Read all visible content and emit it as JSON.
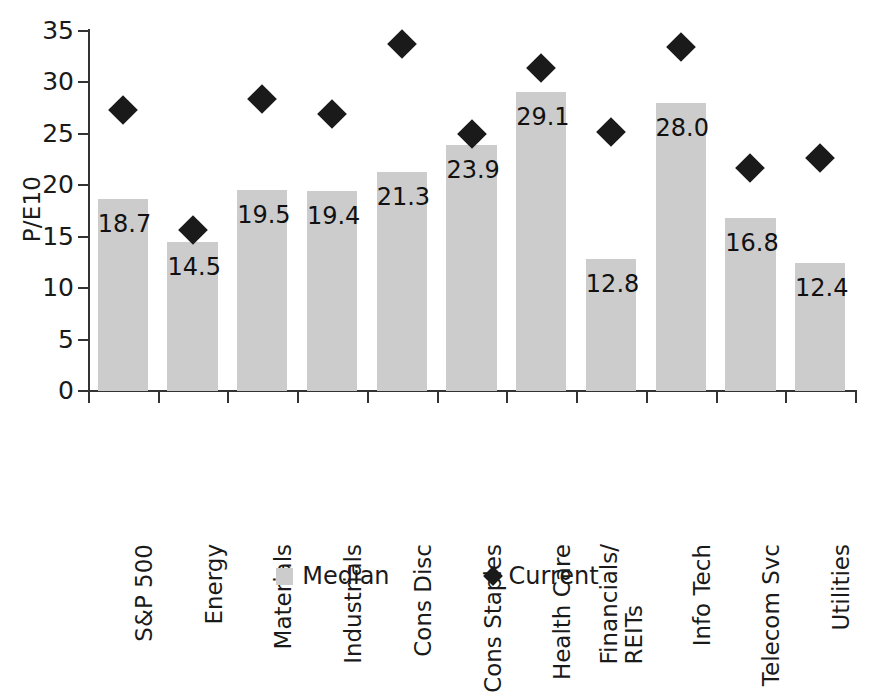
{
  "chart_data": {
    "type": "bar",
    "title": "",
    "xlabel": "",
    "ylabel": "P/E10",
    "ylim": [
      0,
      35
    ],
    "yticks": [
      0,
      5,
      10,
      15,
      20,
      25,
      30,
      35
    ],
    "grid": false,
    "legend_position": "bottom",
    "categories": [
      "S&P 500",
      "Energy",
      "Materials",
      "Industrials",
      "Cons Disc",
      "Cons Staples",
      "Health Care",
      "Financials/\nREITs",
      "Info Tech",
      "Telecom Svc",
      "Utilities"
    ],
    "series": [
      {
        "name": "Median",
        "type": "bar",
        "color": "#cccccc",
        "values": [
          18.7,
          14.5,
          19.5,
          19.4,
          21.3,
          23.9,
          29.1,
          12.8,
          28.0,
          16.8,
          12.4
        ],
        "labels": [
          "18.7",
          "14.5",
          "19.5",
          "19.4",
          "21.3",
          "23.9",
          "29.1",
          "12.8",
          "28.0",
          "16.8",
          "12.4"
        ]
      },
      {
        "name": "Current",
        "type": "scatter",
        "marker": "diamond",
        "color": "#1a1a1a",
        "values": [
          27.3,
          15.7,
          28.4,
          26.9,
          33.7,
          25.0,
          31.4,
          25.2,
          33.4,
          21.7,
          22.7
        ],
        "labels": []
      }
    ]
  },
  "axis": {
    "y_title": "P/E10",
    "y_tick_labels": [
      "35",
      "30",
      "25",
      "20",
      "15",
      "10",
      "5",
      "0"
    ]
  },
  "legend": {
    "items": [
      {
        "label": "Median",
        "marker": "square-swatch",
        "color": "#cccccc"
      },
      {
        "label": "Current",
        "marker": "diamond-swatch",
        "color": "#1a1a1a"
      }
    ]
  },
  "colors": {
    "bar_fill": "#cccccc",
    "marker": "#1a1a1a",
    "axis": "#333333",
    "text": "#1a1a1a",
    "background": "#ffffff"
  }
}
